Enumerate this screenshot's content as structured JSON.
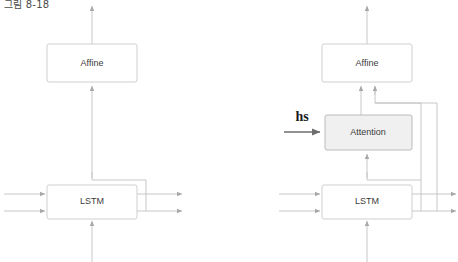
{
  "figure": {
    "caption": "그림 8-18",
    "background_color": "#ffffff",
    "width": 458,
    "height": 262
  },
  "palette": {
    "wire": "#c2c2c2",
    "wire_emphasis": "#6e6e6e",
    "box_stroke": "#c9c9c9",
    "box_fill": "#ffffff",
    "shaded_box_stroke": "#b4b4b4",
    "shaded_box_fill": "#f0f0f0",
    "text": "#3c3c3c",
    "label_text": "#1a1a1a"
  },
  "panels": [
    {
      "id": "left-panel",
      "name": "basic-decoder",
      "nodes": [
        {
          "id": "left-affine",
          "label": "Affine",
          "style": "plain",
          "x": 47,
          "y": 44,
          "w": 90,
          "h": 38
        },
        {
          "id": "left-lstm",
          "label": "LSTM",
          "style": "plain",
          "x": 47,
          "y": 185,
          "w": 90,
          "h": 34
        }
      ],
      "inputs": [
        {
          "id": "left-lstm-in-top",
          "target": "left-lstm"
        },
        {
          "id": "left-lstm-in-bottom",
          "target": "left-lstm"
        },
        {
          "id": "left-lstm-in-below",
          "target": "left-lstm"
        }
      ],
      "outputs": [
        {
          "id": "left-affine-out-top",
          "source": "left-affine"
        },
        {
          "id": "left-lstm-out-top",
          "source": "left-lstm"
        },
        {
          "id": "left-lstm-out-bottom",
          "source": "left-lstm"
        }
      ],
      "edges": [
        {
          "id": "left-lstm-to-affine",
          "from": "left-lstm",
          "to": "left-affine"
        }
      ]
    },
    {
      "id": "right-panel",
      "name": "attention-decoder",
      "nodes": [
        {
          "id": "right-affine",
          "label": "Affine",
          "style": "plain",
          "x": 322,
          "y": 44,
          "w": 90,
          "h": 38
        },
        {
          "id": "right-attention",
          "label": "Attention",
          "style": "shaded",
          "x": 325,
          "y": 115,
          "w": 87,
          "h": 35
        },
        {
          "id": "right-lstm",
          "label": "LSTM",
          "style": "plain",
          "x": 322,
          "y": 185,
          "w": 90,
          "h": 34
        }
      ],
      "annotations": [
        {
          "id": "hs-label",
          "text": "hs",
          "x": 302,
          "y": 118
        }
      ],
      "inputs": [
        {
          "id": "right-lstm-in-top",
          "target": "right-lstm"
        },
        {
          "id": "right-lstm-in-bottom",
          "target": "right-lstm"
        },
        {
          "id": "right-lstm-in-below",
          "target": "right-lstm"
        },
        {
          "id": "hs-into-attention",
          "target": "right-attention",
          "label": "hs"
        }
      ],
      "outputs": [
        {
          "id": "right-affine-out-top",
          "source": "right-affine"
        },
        {
          "id": "right-lstm-out-top",
          "source": "right-lstm"
        },
        {
          "id": "right-lstm-out-bottom",
          "source": "right-lstm"
        }
      ],
      "edges": [
        {
          "id": "right-lstm-to-attention",
          "from": "right-lstm",
          "to": "right-attention"
        },
        {
          "id": "right-attention-to-affine",
          "from": "right-attention",
          "to": "right-affine"
        },
        {
          "id": "right-lstm-bypass-to-affine",
          "from": "right-lstm",
          "to": "right-affine"
        }
      ]
    }
  ]
}
